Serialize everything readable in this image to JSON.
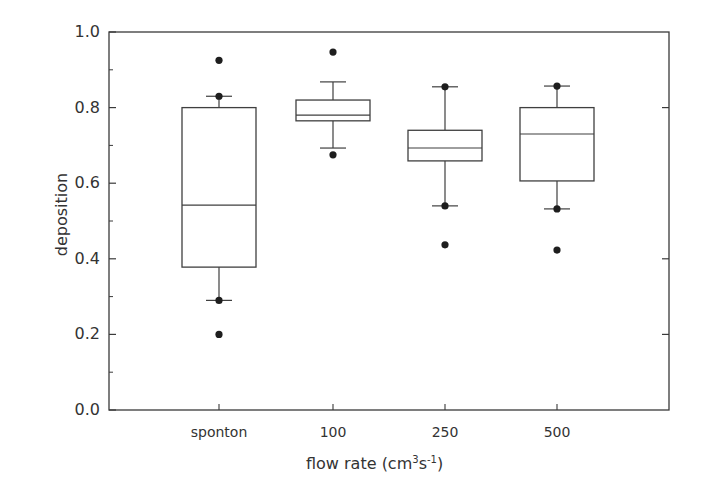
{
  "chart_data": {
    "type": "box",
    "title": "",
    "xlabel": "flow rate (cm³s⁻¹)",
    "xlabel_parts": {
      "main": "flow rate (cm",
      "sup1": "3",
      "mid": "s",
      "sup2": "-1",
      "end": ")"
    },
    "ylabel": "deposition",
    "ylim": [
      0.0,
      1.0
    ],
    "yticks": [
      "0.0",
      "0.2",
      "0.4",
      "0.6",
      "0.8",
      "1.0"
    ],
    "ytick_values": [
      0.0,
      0.2,
      0.4,
      0.6,
      0.8,
      1.0
    ],
    "yminor_values": [
      0.1,
      0.3,
      0.5,
      0.7,
      0.9
    ],
    "right_axis_ticks": [
      0.2,
      0.4,
      0.8
    ],
    "grid": false,
    "legend": null,
    "categories": [
      "sponton",
      "100",
      "250",
      "500"
    ],
    "boxes": [
      {
        "category": "sponton",
        "whisker_low": 0.29,
        "q1": 0.378,
        "median": 0.542,
        "q3": 0.8,
        "whisker_high": 0.83,
        "outliers": [
          0.2,
          0.29,
          0.83,
          0.925
        ]
      },
      {
        "category": "100",
        "whisker_low": 0.693,
        "q1": 0.765,
        "median": 0.78,
        "q3": 0.82,
        "whisker_high": 0.868,
        "outliers": [
          0.675,
          0.947
        ]
      },
      {
        "category": "250",
        "whisker_low": 0.54,
        "q1": 0.659,
        "median": 0.693,
        "q3": 0.74,
        "whisker_high": 0.855,
        "outliers": [
          0.437,
          0.54,
          0.855
        ]
      },
      {
        "category": "500",
        "whisker_low": 0.532,
        "q1": 0.606,
        "median": 0.73,
        "q3": 0.8,
        "whisker_high": 0.857,
        "outliers": [
          0.423,
          0.532,
          0.857
        ]
      }
    ]
  },
  "layout": {
    "plot_left": 109,
    "plot_right": 669,
    "plot_top": 32,
    "plot_bottom": 410,
    "category_x": [
      219,
      333,
      445,
      557
    ],
    "box_half_width": 37,
    "cap_half_width": 13,
    "colors": {
      "axis": "#3a3a3a",
      "box": "#3f3f3f",
      "dot": "#1e1e1e",
      "text": "#333333"
    }
  }
}
